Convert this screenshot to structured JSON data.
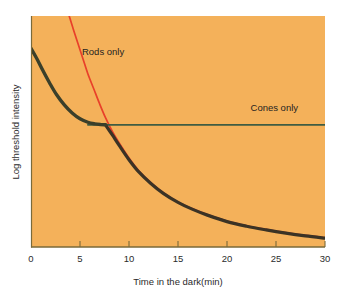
{
  "chart_data": {
    "type": "line",
    "title": "",
    "subtitle": "",
    "xlabel": "Time in the dark(min)",
    "ylabel": "Log threshold intensity",
    "xlim": [
      0,
      30
    ],
    "ylim": [
      0,
      10
    ],
    "xticks": [
      0,
      5,
      10,
      15,
      20,
      25,
      30
    ],
    "xtick_labels": [
      "0",
      "5",
      "10",
      "15",
      "20",
      "25",
      "30"
    ],
    "yticks": [],
    "ytick_labels": [],
    "grid": false,
    "legend_position": "inline-annotations",
    "plot_background": "#f4b15a",
    "figure_background": "#ffffff",
    "annotations": [
      {
        "text": "Rods only",
        "x": 5.2,
        "y": 8.3,
        "color": "#1f1f1f"
      },
      {
        "text": "Cones only",
        "x": 22.4,
        "y": 5.9,
        "color": "#1f1f1f"
      }
    ],
    "series": [
      {
        "name": "Rods only",
        "color": "#e8402a",
        "x": [
          3.9,
          4.3,
          4.8,
          5.3,
          5.8,
          6.4,
          7.0,
          7.6,
          8.3,
          9.0,
          10.0,
          11.0,
          12.2,
          13.5,
          15.0,
          16.5,
          18.0,
          20.0,
          22.0,
          24.0,
          26.0,
          28.0,
          30.0
        ],
        "y": [
          10.0,
          9.45,
          8.8,
          8.15,
          7.5,
          6.85,
          6.2,
          5.6,
          5.0,
          4.5,
          3.85,
          3.3,
          2.8,
          2.35,
          1.95,
          1.65,
          1.4,
          1.12,
          0.92,
          0.76,
          0.62,
          0.5,
          0.4
        ]
      },
      {
        "name": "Cones only",
        "color": "#3f5c42",
        "x": [
          0.0,
          0.6,
          1.2,
          1.9,
          2.6,
          3.4,
          4.2,
          5.0,
          5.8,
          6.5,
          7.1,
          7.6,
          30.0
        ],
        "y": [
          8.6,
          8.15,
          7.65,
          7.1,
          6.6,
          6.15,
          5.8,
          5.55,
          5.4,
          5.33,
          5.3,
          5.29,
          5.29
        ]
      },
      {
        "name": "Combined threshold (rod branch)",
        "color": "#3b3325",
        "x": [
          7.6,
          8.3,
          9.0,
          10.0,
          11.0,
          12.2,
          13.5,
          15.0,
          16.5,
          18.0,
          20.0,
          22.0,
          24.0,
          26.0,
          28.0,
          30.0
        ],
        "y": [
          5.29,
          4.85,
          4.4,
          3.78,
          3.25,
          2.76,
          2.32,
          1.93,
          1.63,
          1.38,
          1.1,
          0.9,
          0.74,
          0.6,
          0.48,
          0.38
        ]
      }
    ]
  },
  "colors": {
    "rods": "#e8402a",
    "cones": "#3f5c42",
    "combined": "#3b3325",
    "axis": "#7a6a3a",
    "plot_bg": "#f4b15a",
    "text": "#2b2b2b"
  }
}
